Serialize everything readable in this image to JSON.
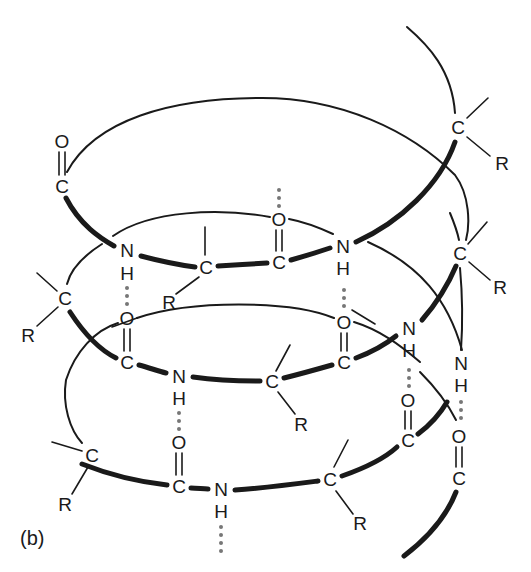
{
  "figure": {
    "panel_label": "(b)",
    "colors": {
      "ink": "#1a1a1a",
      "hydrogen_bond": "#777777",
      "background": "#ffffff"
    }
  },
  "atoms": [
    {
      "id": "o1",
      "symbol": "O",
      "x": 62,
      "y": 141
    },
    {
      "id": "c1",
      "symbol": "C",
      "x": 62,
      "y": 186
    },
    {
      "id": "n1",
      "symbol": "N",
      "x": 127,
      "y": 250
    },
    {
      "id": "h1",
      "symbol": "H",
      "x": 127,
      "y": 273
    },
    {
      "id": "ca1",
      "symbol": "C",
      "x": 206,
      "y": 267
    },
    {
      "id": "r_ca1",
      "symbol": "R",
      "x": 169,
      "y": 302
    },
    {
      "id": "o2",
      "symbol": "O",
      "x": 279,
      "y": 219
    },
    {
      "id": "c2",
      "symbol": "C",
      "x": 279,
      "y": 262
    },
    {
      "id": "n2",
      "symbol": "N",
      "x": 343,
      "y": 246
    },
    {
      "id": "h2",
      "symbol": "H",
      "x": 343,
      "y": 268
    },
    {
      "id": "ca_top",
      "symbol": "C",
      "x": 458,
      "y": 127
    },
    {
      "id": "r_ca_top",
      "symbol": "R",
      "x": 502,
      "y": 163
    },
    {
      "id": "ca_right",
      "symbol": "C",
      "x": 460,
      "y": 253
    },
    {
      "id": "r_ca_right",
      "symbol": "R",
      "x": 500,
      "y": 287
    },
    {
      "id": "ca_left",
      "symbol": "C",
      "x": 65,
      "y": 298
    },
    {
      "id": "r_ca_left",
      "symbol": "R",
      "x": 28,
      "y": 335
    },
    {
      "id": "o3",
      "symbol": "O",
      "x": 127,
      "y": 318
    },
    {
      "id": "c3",
      "symbol": "C",
      "x": 127,
      "y": 362
    },
    {
      "id": "n3",
      "symbol": "N",
      "x": 179,
      "y": 376
    },
    {
      "id": "h3",
      "symbol": "H",
      "x": 179,
      "y": 398
    },
    {
      "id": "ca3",
      "symbol": "C",
      "x": 272,
      "y": 381
    },
    {
      "id": "r_ca3",
      "symbol": "R",
      "x": 301,
      "y": 424
    },
    {
      "id": "o4",
      "symbol": "O",
      "x": 344,
      "y": 322
    },
    {
      "id": "c4",
      "symbol": "C",
      "x": 344,
      "y": 362
    },
    {
      "id": "n4",
      "symbol": "N",
      "x": 409,
      "y": 328
    },
    {
      "id": "h4",
      "symbol": "H",
      "x": 409,
      "y": 350
    },
    {
      "id": "n5",
      "symbol": "N",
      "x": 461,
      "y": 363
    },
    {
      "id": "h5",
      "symbol": "H",
      "x": 461,
      "y": 385
    },
    {
      "id": "o5",
      "symbol": "O",
      "x": 408,
      "y": 400
    },
    {
      "id": "c5",
      "symbol": "C",
      "x": 408,
      "y": 440
    },
    {
      "id": "o6",
      "symbol": "O",
      "x": 459,
      "y": 436
    },
    {
      "id": "c6",
      "symbol": "C",
      "x": 459,
      "y": 478
    },
    {
      "id": "ca_bl",
      "symbol": "C",
      "x": 92,
      "y": 455
    },
    {
      "id": "r_ca_bl",
      "symbol": "R",
      "x": 65,
      "y": 504
    },
    {
      "id": "o7",
      "symbol": "O",
      "x": 179,
      "y": 442
    },
    {
      "id": "c7",
      "symbol": "C",
      "x": 179,
      "y": 486
    },
    {
      "id": "n7",
      "symbol": "N",
      "x": 221,
      "y": 489
    },
    {
      "id": "h7",
      "symbol": "H",
      "x": 221,
      "y": 511
    },
    {
      "id": "ca_br",
      "symbol": "C",
      "x": 330,
      "y": 479
    },
    {
      "id": "r_ca_br",
      "symbol": "R",
      "x": 360,
      "y": 523
    }
  ]
}
